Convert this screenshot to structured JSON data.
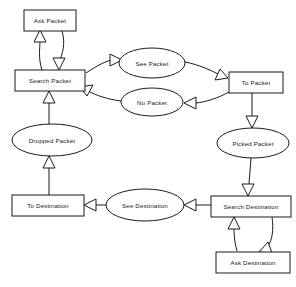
{
  "diagram": {
    "type": "flowchart",
    "background_color": "#ffffff",
    "line_color": "#1a1a1a",
    "node_fill_color": "#ffffff",
    "arrowhead_style": "hollow-triangle",
    "nodes": [
      {
        "id": "ask_packet",
        "label": "Ask Packet",
        "shape": "rectangle",
        "cx": 50,
        "cy": 20,
        "w": 52,
        "h": 21
      },
      {
        "id": "search_packet",
        "label": "Search Packet",
        "shape": "rectangle",
        "cx": 50,
        "cy": 80,
        "w": 70,
        "h": 21
      },
      {
        "id": "see_packet",
        "label": "See Packet",
        "shape": "ellipse",
        "cx": 152,
        "cy": 63,
        "w": 66,
        "h": 30
      },
      {
        "id": "no_packet",
        "label": "No Packet",
        "shape": "ellipse",
        "cx": 152,
        "cy": 102,
        "w": 62,
        "h": 28
      },
      {
        "id": "to_packet",
        "label": "To Packet",
        "shape": "rectangle",
        "cx": 256,
        "cy": 82,
        "w": 54,
        "h": 21
      },
      {
        "id": "picked_packet",
        "label": "Picked Packet",
        "shape": "ellipse",
        "cx": 253,
        "cy": 143,
        "w": 72,
        "h": 30
      },
      {
        "id": "dropped_packet",
        "label": "Dropped Packet",
        "shape": "ellipse",
        "cx": 52,
        "cy": 140,
        "w": 80,
        "h": 31
      },
      {
        "id": "to_destination",
        "label": "To Destination",
        "shape": "rectangle",
        "cx": 48,
        "cy": 205,
        "w": 72,
        "h": 21
      },
      {
        "id": "see_destination",
        "label": "See Destination",
        "shape": "ellipse",
        "cx": 145,
        "cy": 205,
        "w": 78,
        "h": 31
      },
      {
        "id": "search_destination",
        "label": "Search Destination",
        "shape": "rectangle",
        "cx": 251,
        "cy": 206,
        "w": 80,
        "h": 21
      },
      {
        "id": "ask_destination",
        "label": "Ask Destination",
        "shape": "rectangle",
        "cx": 253,
        "cy": 262,
        "w": 74,
        "h": 21
      }
    ],
    "edges": [
      {
        "from": "search_packet",
        "to": "ask_packet"
      },
      {
        "from": "ask_packet",
        "to": "search_packet"
      },
      {
        "from": "search_packet",
        "to": "see_packet"
      },
      {
        "from": "see_packet",
        "to": "to_packet"
      },
      {
        "from": "to_packet",
        "to": "no_packet"
      },
      {
        "from": "no_packet",
        "to": "search_packet"
      },
      {
        "from": "to_packet",
        "to": "picked_packet"
      },
      {
        "from": "dropped_packet",
        "to": "search_packet"
      },
      {
        "from": "to_destination",
        "to": "dropped_packet"
      },
      {
        "from": "see_destination",
        "to": "to_destination"
      },
      {
        "from": "search_destination",
        "to": "see_destination"
      },
      {
        "from": "picked_packet",
        "to": "search_destination"
      },
      {
        "from": "search_destination",
        "to": "ask_destination"
      },
      {
        "from": "ask_destination",
        "to": "search_destination"
      }
    ]
  }
}
